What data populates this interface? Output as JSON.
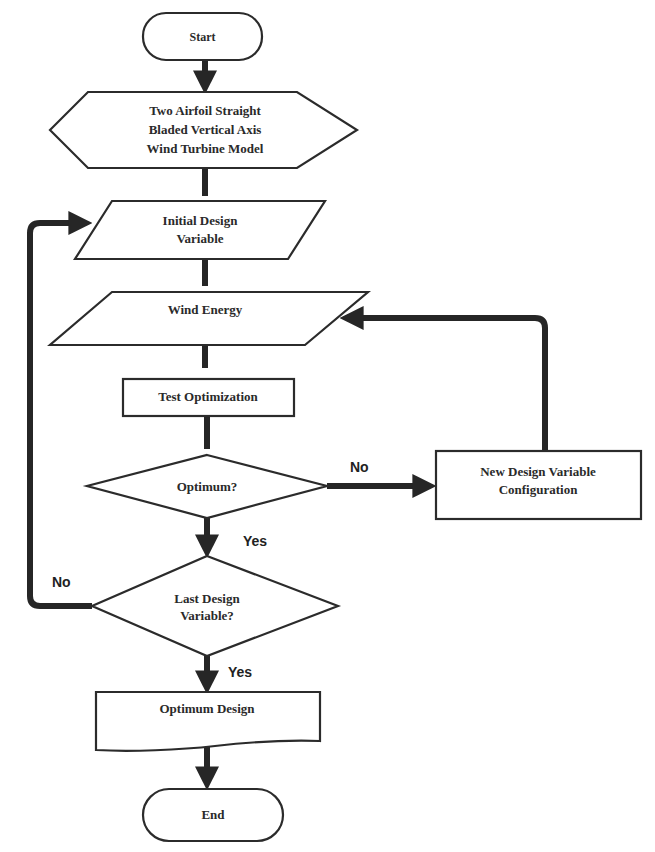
{
  "diagram": {
    "type": "flowchart",
    "nodes": {
      "start": {
        "label": "Start",
        "shape": "terminal"
      },
      "model": {
        "lines": [
          "Two Airfoil Straight",
          "Bladed Vertical Axis",
          "Wind Turbine Model"
        ],
        "shape": "hexagon"
      },
      "initial": {
        "lines": [
          "Initial Design",
          "Variable"
        ],
        "shape": "parallelogram"
      },
      "wind": {
        "label": "Wind Energy",
        "shape": "parallelogram"
      },
      "test": {
        "label": "Test Optimization",
        "shape": "rectangle"
      },
      "optimum_q": {
        "label": "Optimum?",
        "shape": "diamond"
      },
      "new_design": {
        "lines": [
          "New Design Variable",
          "Configuration"
        ],
        "shape": "rectangle"
      },
      "last_q": {
        "lines": [
          "Last Design",
          "Variable?"
        ],
        "shape": "diamond"
      },
      "optimum_design": {
        "label": "Optimum Design",
        "shape": "document"
      },
      "end": {
        "label": "End",
        "shape": "terminal"
      }
    },
    "edge_labels": {
      "optimum_no": "No",
      "optimum_yes": "Yes",
      "last_no": "No",
      "last_yes": "Yes"
    },
    "edges": [
      {
        "from": "start",
        "to": "model"
      },
      {
        "from": "model",
        "to": "initial"
      },
      {
        "from": "initial",
        "to": "wind"
      },
      {
        "from": "wind",
        "to": "test"
      },
      {
        "from": "test",
        "to": "optimum_q"
      },
      {
        "from": "optimum_q",
        "to": "new_design",
        "label": "No"
      },
      {
        "from": "new_design",
        "to": "wind"
      },
      {
        "from": "optimum_q",
        "to": "last_q",
        "label": "Yes"
      },
      {
        "from": "last_q",
        "to": "initial",
        "label": "No"
      },
      {
        "from": "last_q",
        "to": "optimum_design",
        "label": "Yes"
      },
      {
        "from": "optimum_design",
        "to": "end"
      }
    ]
  }
}
